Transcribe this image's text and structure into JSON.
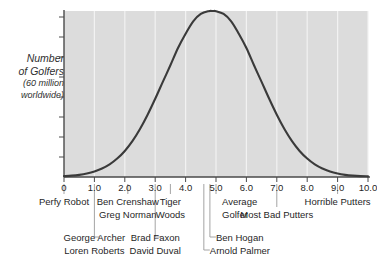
{
  "chart_data": {
    "type": "line",
    "title": "",
    "subtitle": "",
    "xlabel": "",
    "ylabel": "Number of Golfers (60 million worldwide)",
    "ylabel_lines": [
      "Number",
      "of Golfers",
      "(60 million",
      "worldwide)"
    ],
    "xlim": [
      0,
      10
    ],
    "ylim": [
      0,
      1
    ],
    "grid": "vertical-white-gridlines-at-each-major-tick",
    "legend": "none",
    "xticks": [
      "0",
      "1.0",
      "2.0",
      "3.0",
      "4.0",
      "5.0",
      "6.0",
      "7.0",
      "8.0",
      "9.0",
      "10.0"
    ],
    "xtick_values": [
      0,
      1,
      2,
      3,
      4,
      5,
      6,
      7,
      8,
      9,
      10
    ],
    "ytick_count": 8,
    "ytick_labels": [],
    "curve": {
      "name": "Distribution of golfers",
      "peak_x": 4.9,
      "mean": 4.9,
      "stddev": 1.55,
      "x": [
        0.0,
        0.25,
        0.5,
        0.75,
        1.0,
        1.25,
        1.5,
        1.75,
        2.0,
        2.25,
        2.5,
        2.75,
        3.0,
        3.25,
        3.5,
        3.75,
        4.0,
        4.25,
        4.5,
        4.75,
        4.9,
        5.0,
        5.25,
        5.5,
        5.75,
        6.0,
        6.25,
        6.5,
        6.75,
        7.0,
        7.25,
        7.5,
        7.75,
        8.0,
        8.25,
        8.5,
        8.75,
        9.0,
        9.25,
        9.5,
        9.75,
        10.0
      ],
      "y": [
        0.005,
        0.008,
        0.013,
        0.021,
        0.033,
        0.051,
        0.076,
        0.111,
        0.157,
        0.216,
        0.289,
        0.375,
        0.471,
        0.573,
        0.673,
        0.777,
        0.863,
        0.938,
        0.982,
        0.999,
        1.0,
        0.999,
        0.982,
        0.938,
        0.863,
        0.777,
        0.673,
        0.573,
        0.471,
        0.375,
        0.289,
        0.216,
        0.157,
        0.111,
        0.076,
        0.051,
        0.033,
        0.021,
        0.013,
        0.008,
        0.005,
        0.004
      ]
    },
    "annotations": [
      {
        "label": "Perfy Robot",
        "x": 0.0,
        "row": 1,
        "align": "center"
      },
      {
        "label": "Ben Crenshaw",
        "x": 2.1,
        "row": 1,
        "align": "center"
      },
      {
        "label": "Greg Norman",
        "x": 2.1,
        "row": 2,
        "align": "center"
      },
      {
        "label": "Tiger",
        "x": 3.5,
        "row": 1,
        "align": "center"
      },
      {
        "label": "Woods",
        "x": 3.5,
        "row": 2,
        "align": "center"
      },
      {
        "label": "Average",
        "x": 5.0,
        "row": 1,
        "align": "left"
      },
      {
        "label": "Golfer",
        "x": 5.0,
        "row": 2,
        "align": "left"
      },
      {
        "label": "Most Bad Putters",
        "x": 7.0,
        "row": 2,
        "align": "center"
      },
      {
        "label": "Horrible Putters",
        "x": 9.0,
        "row": 1,
        "align": "center"
      },
      {
        "label": "George Archer",
        "x": 1.0,
        "row": 3,
        "align": "center"
      },
      {
        "label": "Loren Roberts",
        "x": 1.0,
        "row": 4,
        "align": "center"
      },
      {
        "label": "Brad Faxon",
        "x": 3.0,
        "row": 3,
        "align": "center"
      },
      {
        "label": "David Duval",
        "x": 3.0,
        "row": 4,
        "align": "center"
      },
      {
        "label": "Ben Hogan",
        "x": 4.8,
        "row": 3,
        "align": "left"
      },
      {
        "label": "Arnold Palmer",
        "x": 4.6,
        "row": 4,
        "align": "left"
      }
    ],
    "leader_lines": [
      {
        "x": 0.0,
        "to_row": 1
      },
      {
        "x": 1.0,
        "to_row": 3
      },
      {
        "x": 2.1,
        "to_row": 1
      },
      {
        "x": 3.0,
        "to_row": 3
      },
      {
        "x": 3.5,
        "to_row": 1
      },
      {
        "x": 4.6,
        "to_row": 4
      },
      {
        "x": 4.8,
        "to_row": 3
      },
      {
        "x": 5.0,
        "to_row": 1
      },
      {
        "x": 7.0,
        "to_row": 2
      },
      {
        "x": 9.0,
        "to_row": 1
      }
    ],
    "colors": {
      "plot_background": "#dcdcdc",
      "gridline": "#f2f2f2",
      "curve": "#3a3a3a",
      "axis": "#4a4a4a",
      "text": "#1f1f1f",
      "leader": "#9a9a9a",
      "page_background": "#ffffff"
    }
  }
}
